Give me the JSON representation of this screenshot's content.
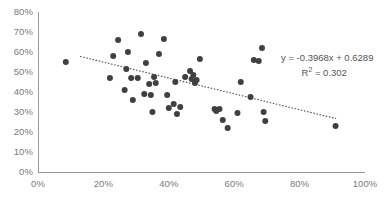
{
  "chart_data": {
    "type": "scatter",
    "title": "",
    "subtitle": "",
    "xlabel": "",
    "ylabel": "",
    "xlim": [
      0,
      100
    ],
    "ylim": [
      0,
      80
    ],
    "grid": false,
    "legend": null,
    "x_tick_labels": [
      "0%",
      "20%",
      "40%",
      "60%",
      "80%",
      "100%"
    ],
    "x_ticks": [
      0,
      20,
      40,
      60,
      80,
      100
    ],
    "y_tick_labels": [
      "0%",
      "10%",
      "20%",
      "30%",
      "40%",
      "50%",
      "60%",
      "70%",
      "80%"
    ],
    "y_ticks": [
      0,
      10,
      20,
      30,
      40,
      50,
      60,
      70,
      80
    ],
    "marker_color": "#404040",
    "marker_size": 6,
    "axis_color": "#9a9a9a",
    "tick_label_color": "#7a7a7a",
    "points": [
      [
        8.5,
        55.0
      ],
      [
        22.0,
        47.0
      ],
      [
        23.0,
        58.0
      ],
      [
        24.5,
        66.0
      ],
      [
        26.5,
        41.0
      ],
      [
        27.0,
        51.5
      ],
      [
        27.5,
        60.0
      ],
      [
        28.5,
        47.0
      ],
      [
        29.0,
        36.0
      ],
      [
        30.5,
        47.0
      ],
      [
        31.5,
        69.0
      ],
      [
        32.5,
        39.0
      ],
      [
        33.0,
        54.5
      ],
      [
        34.0,
        44.0
      ],
      [
        34.5,
        38.5
      ],
      [
        35.0,
        30.0
      ],
      [
        35.5,
        47.5
      ],
      [
        36.0,
        44.5
      ],
      [
        37.0,
        59.0
      ],
      [
        38.5,
        66.5
      ],
      [
        39.5,
        38.5
      ],
      [
        40.0,
        32.0
      ],
      [
        41.5,
        34.0
      ],
      [
        42.0,
        45.0
      ],
      [
        42.5,
        29.0
      ],
      [
        43.5,
        32.5
      ],
      [
        45.0,
        47.5
      ],
      [
        46.5,
        50.5
      ],
      [
        47.0,
        46.5
      ],
      [
        47.5,
        48.5
      ],
      [
        48.0,
        44.5
      ],
      [
        48.5,
        46.0
      ],
      [
        49.5,
        56.5
      ],
      [
        54.0,
        31.5
      ],
      [
        54.5,
        30.5
      ],
      [
        55.5,
        31.5
      ],
      [
        56.5,
        26.0
      ],
      [
        58.0,
        22.0
      ],
      [
        61.0,
        29.5
      ],
      [
        62.0,
        45.0
      ],
      [
        65.0,
        37.5
      ],
      [
        66.0,
        56.0
      ],
      [
        67.5,
        55.5
      ],
      [
        68.5,
        62.0
      ],
      [
        69.0,
        30.0
      ],
      [
        69.5,
        25.5
      ],
      [
        91.0,
        23.0
      ]
    ],
    "trendline": {
      "equation": "y = -0.3968x + 0.6289",
      "r_squared_label": "R",
      "r_squared_exponent": "2",
      "r_squared_value": "= 0.302",
      "slope": -0.3968,
      "intercept": 0.6289,
      "r_squared": 0.302,
      "style": "dotted",
      "color": "#555555",
      "x_start": 13.0,
      "x_end": 91.0
    }
  }
}
